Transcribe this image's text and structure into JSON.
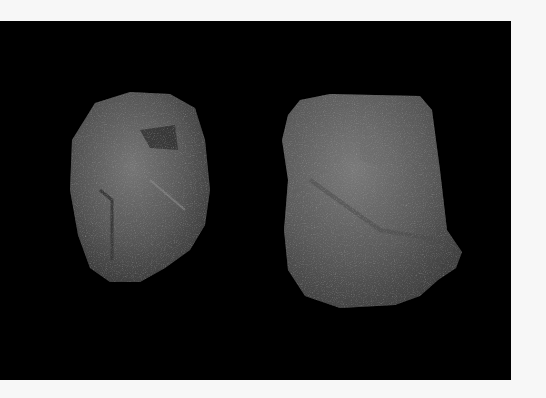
{
  "scene": {
    "page_background": "#f7f7f7",
    "photo_background": "#000000",
    "subjects": [
      {
        "name": "left-stone",
        "color": "#5a5a5a",
        "highlight": "#7a7a7a"
      },
      {
        "name": "right-stone",
        "color": "#5e5e5e",
        "highlight": "#808080"
      }
    ]
  }
}
